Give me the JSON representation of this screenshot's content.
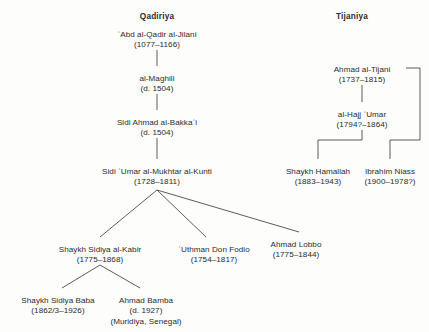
{
  "figure": {
    "type": "genealogy-tree-diagram",
    "background_color": "#fdfdfc",
    "line_color": "#4a4a4a",
    "text_color": "#2b2b2b"
  },
  "columns": [
    {
      "id": "qadiriya",
      "label": "Qadiriya",
      "x": 157
    },
    {
      "id": "tijaniya",
      "label": "Tijaniya",
      "x": 352
    }
  ],
  "nodes": [
    {
      "id": "abd-al-qadir-al-jilani",
      "name": "ʿAbd al-Qadir al-Jilani",
      "dates": "(1077–1166)",
      "extra": "",
      "x": 157,
      "y": 30,
      "branch": "qadiriya"
    },
    {
      "id": "al-maghili",
      "name": "al-Maghili",
      "dates": "(d. 1504)",
      "extra": "",
      "x": 157,
      "y": 74,
      "branch": "qadiriya"
    },
    {
      "id": "sidi-ahmad-al-bakkai",
      "name": "Sidi Ahmad al-Bakkaʿi",
      "dates": "(d. 1504)",
      "extra": "",
      "x": 157,
      "y": 118,
      "branch": "qadiriya"
    },
    {
      "id": "sidi-umar-al-mukhtar-al-kunti",
      "name": "Sidi ʿUmar al-Mukhtar al-Kunti",
      "dates": "(1728–1811)",
      "extra": "",
      "x": 157,
      "y": 167,
      "branch": "qadiriya"
    },
    {
      "id": "shaykh-sidiya-al-kabir",
      "name": "Shaykh Sidiya al-Kabir",
      "dates": "(1775–1868)",
      "extra": "",
      "x": 100,
      "y": 245,
      "branch": "qadiriya"
    },
    {
      "id": "uthman-don-fodio",
      "name": "ʿUthman Don Fodio",
      "dates": "(1754–1817)",
      "extra": "",
      "x": 214,
      "y": 245,
      "branch": "qadiriya"
    },
    {
      "id": "ahmad-lobbo",
      "name": "Ahmad Lobbo",
      "dates": "(1775–1844)",
      "extra": "",
      "x": 296,
      "y": 240,
      "branch": "qadiriya"
    },
    {
      "id": "shaykh-sidiya-baba",
      "name": "Shaykh Sidiya Baba",
      "dates": "(1862/3–1926)",
      "extra": "",
      "x": 58,
      "y": 296,
      "branch": "qadiriya"
    },
    {
      "id": "ahmad-bamba",
      "name": "Ahmad Bamba",
      "dates": "(d. 1927)",
      "extra": "(Muridiya, Senegal)",
      "x": 146,
      "y": 296,
      "branch": "qadiriya"
    },
    {
      "id": "ahmad-al-tijani",
      "name": "Ahmad al-Tijani",
      "dates": "(1737–1815)",
      "extra": "",
      "x": 362,
      "y": 65,
      "branch": "tijaniya"
    },
    {
      "id": "al-hajj-umar",
      "name": "al-Hajj ʿUmar",
      "dates": "(1794?–1864)",
      "extra": "",
      "x": 362,
      "y": 110,
      "branch": "tijaniya"
    },
    {
      "id": "shaykh-hamallah",
      "name": "Shaykh Hamallah",
      "dates": "(1883–1943)",
      "extra": "",
      "x": 318,
      "y": 167,
      "branch": "tijaniya"
    },
    {
      "id": "ibrahim-niass",
      "name": "Ibrahim Niass",
      "dates": "(1900–1978?)",
      "extra": "",
      "x": 390,
      "y": 167,
      "branch": "tijaniya"
    }
  ]
}
